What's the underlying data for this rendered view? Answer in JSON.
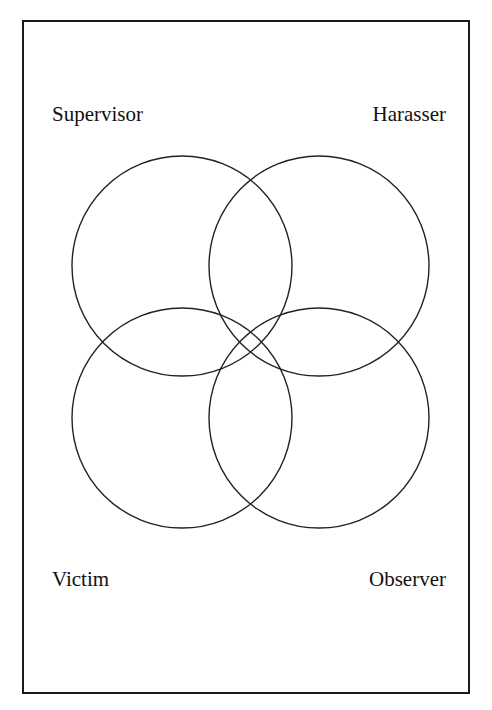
{
  "diagram": {
    "type": "venn",
    "sets": [
      {
        "id": "supervisor",
        "label": "Supervisor",
        "position": "top-left",
        "cx": 182,
        "cy": 266,
        "r": 110
      },
      {
        "id": "harasser",
        "label": "Harasser",
        "position": "top-right",
        "cx": 319,
        "cy": 266,
        "r": 110
      },
      {
        "id": "victim",
        "label": "Victim",
        "position": "bottom-left",
        "cx": 182,
        "cy": 418,
        "r": 110
      },
      {
        "id": "observer",
        "label": "Observer",
        "position": "bottom-right",
        "cx": 319,
        "cy": 418,
        "r": 110
      }
    ],
    "stroke_color": "#222222",
    "border_color": "#1a1a1a"
  }
}
